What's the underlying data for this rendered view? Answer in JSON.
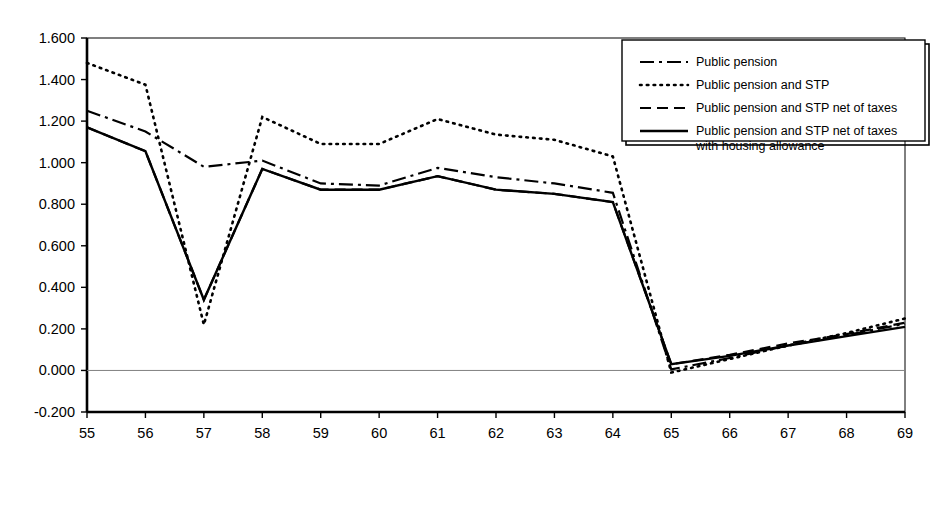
{
  "chart_data": {
    "type": "line",
    "title": "",
    "subtitle": "",
    "xlabel": "",
    "ylabel": "",
    "x": [
      55,
      56,
      57,
      58,
      59,
      60,
      61,
      62,
      63,
      64,
      65,
      66,
      67,
      68,
      69
    ],
    "xtick_labels": [
      "55",
      "56",
      "57",
      "58",
      "59",
      "60",
      "61",
      "62",
      "63",
      "64",
      "65",
      "66",
      "67",
      "68",
      "69"
    ],
    "ytick_labels": [
      "-0.200",
      "0.000",
      "0.200",
      "0.400",
      "0.600",
      "0.800",
      "1.000",
      "1.200",
      "1.400",
      "1.600"
    ],
    "ytick_values": [
      -0.2,
      0.0,
      0.2,
      0.4,
      0.6,
      0.8,
      1.0,
      1.2,
      1.4,
      1.6
    ],
    "xlim": [
      55,
      69
    ],
    "ylim": [
      -0.2,
      1.6
    ],
    "grid": false,
    "zero_line": true,
    "legend_position": "top-right",
    "series": [
      {
        "name": "Public pension",
        "style": "dash-dot",
        "color": "#000000",
        "values": [
          1.25,
          1.15,
          0.98,
          1.01,
          0.9,
          0.89,
          0.975,
          0.93,
          0.9,
          0.855,
          0.005,
          0.06,
          0.12,
          0.17,
          0.225
        ]
      },
      {
        "name": "Public pension and STP",
        "style": "dotted",
        "color": "#000000",
        "values": [
          1.48,
          1.375,
          0.22,
          1.22,
          1.09,
          1.09,
          1.21,
          1.135,
          1.11,
          1.03,
          -0.01,
          0.055,
          0.12,
          0.18,
          0.25
        ]
      },
      {
        "name": "Public pension and STP net of taxes",
        "style": "dashed",
        "color": "#000000",
        "values": [
          1.17,
          1.055,
          0.34,
          0.97,
          0.87,
          0.87,
          0.935,
          0.87,
          0.85,
          0.81,
          0.03,
          0.075,
          0.13,
          0.175,
          0.23
        ]
      },
      {
        "name": "Public pension and STP net of taxes with housing allowance",
        "style": "solid",
        "color": "#000000",
        "values": [
          1.17,
          1.055,
          0.34,
          0.97,
          0.87,
          0.87,
          0.935,
          0.87,
          0.85,
          0.81,
          0.03,
          0.07,
          0.12,
          0.165,
          0.21
        ]
      }
    ],
    "legend_entries": [
      {
        "label": "Public pension",
        "style": "dash-dot"
      },
      {
        "label": "Public pension and STP",
        "style": "dotted"
      },
      {
        "label": "Public pension and STP net of taxes",
        "style": "dashed"
      },
      {
        "label": "Public pension and STP net of taxes",
        "label2": "with housing allowance",
        "style": "solid"
      }
    ]
  }
}
